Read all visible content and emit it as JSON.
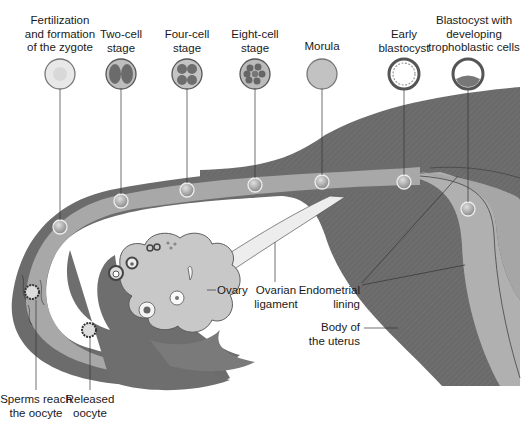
{
  "colors": {
    "uterus_wall": "#6b6b6b",
    "tube_wall": "#6e6e6e",
    "tube_lumen": "#a9a9a9",
    "endometrium": "#b4b4b4",
    "ovary": "#c9c9c9",
    "ligament": "#ececec",
    "background": "#ffffff",
    "leader_line": "#333333"
  },
  "stages": [
    {
      "id": "zygote",
      "lines": [
        "Fertilization",
        "and formation",
        "of the zygote"
      ]
    },
    {
      "id": "two-cell",
      "lines": [
        "Two-cell",
        "stage"
      ]
    },
    {
      "id": "four-cell",
      "lines": [
        "Four-cell",
        "stage"
      ]
    },
    {
      "id": "eight-cell",
      "lines": [
        "Eight-cell",
        "stage"
      ]
    },
    {
      "id": "morula",
      "lines": [
        "Morula"
      ]
    },
    {
      "id": "early-blastocyst",
      "lines": [
        "Early",
        "blastocyst"
      ]
    },
    {
      "id": "blastocyst-trophoblast",
      "lines": [
        "Blastocyst with",
        "developing",
        "trophoblastic cells"
      ]
    }
  ],
  "labels": {
    "ovary": "Ovary",
    "ovarian_ligament": [
      "Ovarian",
      "ligament"
    ],
    "endometrial_lining": [
      "Endometrial",
      "lining"
    ],
    "body_of_uterus": [
      "Body of",
      "the uterus"
    ],
    "sperms_reach": [
      "Sperms reach",
      "the oocyte"
    ],
    "released_oocyte": [
      "Released",
      "oocyte"
    ]
  }
}
